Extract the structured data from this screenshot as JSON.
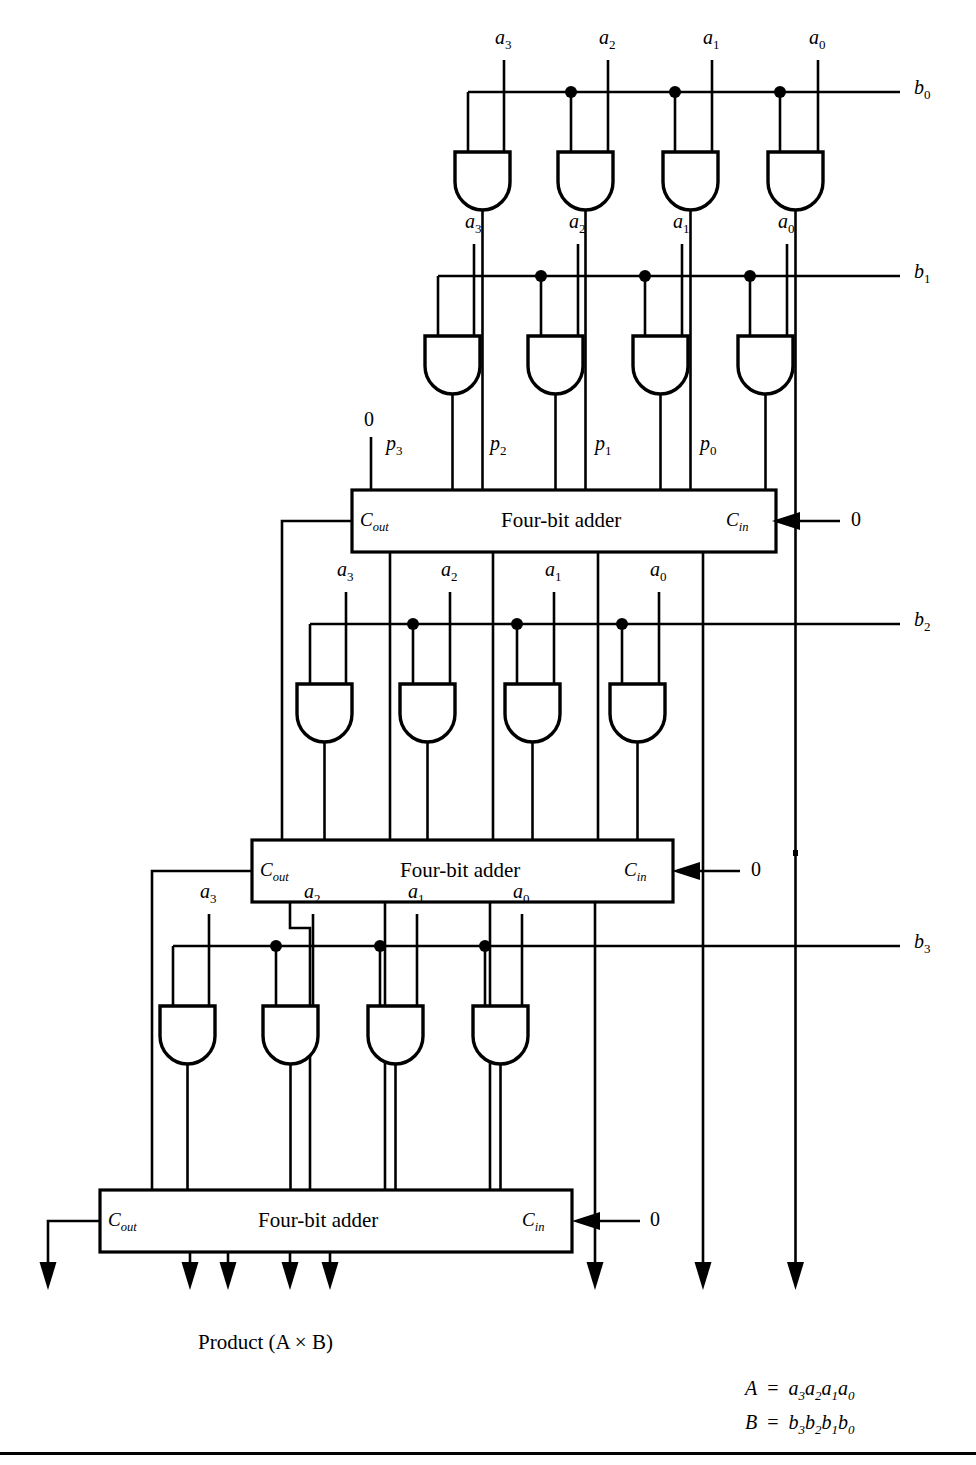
{
  "figure": {
    "type": "logic-circuit-diagram",
    "product_caption": "Product (A × B)",
    "adder_label": "Four-bit adder",
    "cout_label": "C",
    "cout_sub": "out",
    "cin_label": "C",
    "cin_sub": "in",
    "zero_label": "0"
  },
  "legend": {
    "line1_lhs": "A",
    "line1_eq": "=",
    "line1_rhs": [
      "a",
      "3",
      "a",
      "2",
      "a",
      "1",
      "a",
      "0"
    ],
    "line2_lhs": "B",
    "line2_eq": "=",
    "line2_rhs": [
      "b",
      "3",
      "b",
      "2",
      "b",
      "1",
      "b",
      "0"
    ]
  },
  "bus_labels": [
    {
      "name": "b0",
      "base": "b",
      "sub": "0",
      "y": 92
    },
    {
      "name": "b1",
      "base": "b",
      "sub": "1",
      "y": 276
    },
    {
      "name": "b2",
      "base": "b",
      "sub": "2",
      "y": 624
    },
    {
      "name": "b3",
      "base": "b",
      "sub": "3",
      "y": 946
    }
  ],
  "and_rows": [
    {
      "bus": "b0",
      "inputs": [
        "a3",
        "a2",
        "a1",
        "a0"
      ]
    },
    {
      "bus": "b1",
      "inputs": [
        "a3",
        "a2",
        "a1",
        "a0"
      ]
    },
    {
      "bus": "b2",
      "inputs": [
        "a3",
        "a2",
        "a1",
        "a0"
      ]
    },
    {
      "bus": "b3",
      "inputs": [
        "a3",
        "a2",
        "a1",
        "a0"
      ]
    }
  ],
  "partial_products": [
    "p3",
    "p2",
    "p1",
    "p0"
  ],
  "adders": [
    {
      "id": "adder-1",
      "label": "Four-bit adder",
      "cin": "0",
      "cout_to": "adder-2"
    },
    {
      "id": "adder-2",
      "label": "Four-bit adder",
      "cin": "0",
      "cout_to": "adder-3"
    },
    {
      "id": "adder-3",
      "label": "Four-bit adder",
      "cin": "0",
      "cout_to": "product-msb"
    }
  ],
  "a_label_text": {
    "base": "a",
    "subs": [
      "3",
      "2",
      "1",
      "0"
    ]
  },
  "p_label_text": {
    "base": "p",
    "subs": [
      "3",
      "2",
      "1",
      "0"
    ]
  },
  "colors": {
    "ink": "#000000",
    "paper": "#ffffff"
  }
}
